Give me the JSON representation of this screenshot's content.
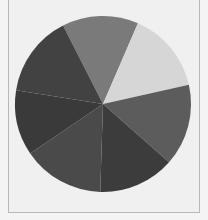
{
  "chart_data": {
    "type": "pie",
    "title": "",
    "legend": [],
    "start_angle_deg": -27,
    "direction": "clockwise",
    "center": [
      103,
      104
    ],
    "radius": 88,
    "slices": [
      {
        "label": "",
        "value": 14,
        "color": "#7a7a7a"
      },
      {
        "label": "",
        "value": 15,
        "color": "#d6d6d6"
      },
      {
        "label": "",
        "value": 15,
        "color": "#5c5c5c"
      },
      {
        "label": "",
        "value": 14,
        "color": "#3c3c3c"
      },
      {
        "label": "",
        "value": 15,
        "color": "#4a4a4a"
      },
      {
        "label": "",
        "value": 12,
        "color": "#3a3a3a"
      },
      {
        "label": "",
        "value": 15,
        "color": "#424242"
      }
    ]
  }
}
